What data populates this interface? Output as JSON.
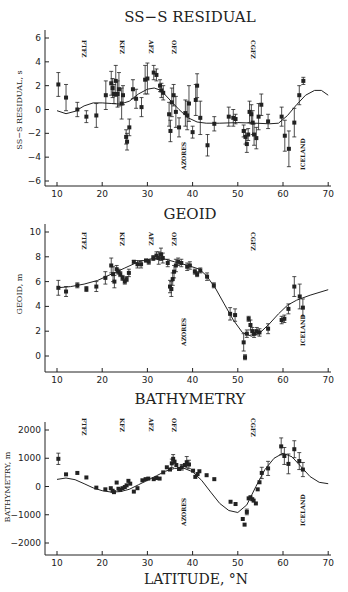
{
  "chart_data": [
    {
      "type": "scatter",
      "title": "SS−S RESIDUAL",
      "xlabel": "",
      "ylabel": "SS−S RESIDUAL, s",
      "xlim": [
        8,
        71
      ],
      "ylim": [
        -6.5,
        6.5
      ],
      "xticks": [
        "10",
        "20",
        "30",
        "40",
        "50",
        "60",
        "70"
      ],
      "yticks": [
        "6",
        "4",
        "2",
        "0",
        "−2",
        "−4",
        "−6"
      ],
      "ytick_values": [
        6,
        4,
        2,
        0,
        -2,
        -4,
        -6
      ],
      "features_top": [
        {
          "label": "FTFZ",
          "lat": 15
        },
        {
          "label": "KFZ",
          "lat": 23.5
        },
        {
          "label": "AFZ",
          "lat": 30
        },
        {
          "label": "OFZ",
          "lat": 35
        },
        {
          "label": "CGFZ",
          "lat": 52.5
        }
      ],
      "features_bottom": [
        {
          "label": "AZORES",
          "lat": 38
        },
        {
          "label": "ICELAND",
          "lat": 64.5
        }
      ],
      "points": [
        [
          10.3,
          2.1,
          1.0
        ],
        [
          12,
          1.0,
          1.1
        ],
        [
          14.5,
          0,
          0.6
        ],
        [
          16.5,
          -0.6,
          0.5
        ],
        [
          18.7,
          -0.5,
          1.0
        ],
        [
          20.8,
          1.2,
          1.2
        ],
        [
          22,
          2.2,
          1.0
        ],
        [
          22.3,
          1.8,
          0.8
        ],
        [
          22.6,
          1.3,
          0.8
        ],
        [
          23,
          2.4,
          1.3
        ],
        [
          23.4,
          1.3,
          1.1
        ],
        [
          23.7,
          1.7,
          1.4
        ],
        [
          24.3,
          0.5,
          1.3
        ],
        [
          24.6,
          1.2,
          0.8
        ],
        [
          25.3,
          -2.3,
          0.6
        ],
        [
          25.5,
          -2.7,
          0.7
        ],
        [
          26,
          -1.5,
          0.7
        ],
        [
          26.8,
          1.7,
          0.8
        ],
        [
          27.5,
          0.9,
          0.8
        ],
        [
          28.7,
          0.2,
          0.8
        ],
        [
          29.5,
          2.5,
          1.2
        ],
        [
          30,
          2.6,
          1.3
        ],
        [
          31.4,
          3.1,
          0.6
        ],
        [
          32,
          2.9,
          0.5
        ],
        [
          32.8,
          2.0,
          0.5
        ],
        [
          33.1,
          1.6,
          0.6
        ],
        [
          33.5,
          1.4,
          0.6
        ],
        [
          34.8,
          -0.4,
          1.0
        ],
        [
          35.1,
          -1.8,
          0.9
        ],
        [
          35.4,
          0.6,
          1.2
        ],
        [
          35.8,
          1.2,
          0.9
        ],
        [
          36.3,
          -0.2,
          1.3
        ],
        [
          37,
          -1.5,
          0.8
        ],
        [
          38.4,
          -0.3,
          1.1
        ],
        [
          38.8,
          -0.5,
          1.2
        ],
        [
          39.2,
          0.5,
          1.5
        ],
        [
          40,
          -1.9,
          0.5
        ],
        [
          40.7,
          0.8,
          1.3
        ],
        [
          41,
          2.0,
          1.0
        ],
        [
          41.7,
          -0.7,
          1.4
        ],
        [
          43.3,
          -3.0,
          0.9
        ],
        [
          44.8,
          -1.2,
          0.6
        ],
        [
          48,
          -0.6,
          0.8
        ],
        [
          49,
          -0.7,
          0.7
        ],
        [
          49.5,
          -0.8,
          0.4
        ],
        [
          51.3,
          -1.8,
          0.5
        ],
        [
          51.7,
          -2.3,
          0.6
        ],
        [
          52,
          -2.9,
          0.7
        ],
        [
          52.3,
          -2.1,
          0.5
        ],
        [
          52.6,
          -0.2,
          0.9
        ],
        [
          53,
          -0.4,
          0.8
        ],
        [
          53.3,
          -1.1,
          1.0
        ],
        [
          53.6,
          -2.1,
          0.9
        ],
        [
          54.1,
          -2.4,
          0.9
        ],
        [
          54.6,
          -0.6,
          1.1
        ],
        [
          55.2,
          0.4,
          0.9
        ],
        [
          56.7,
          -1.0,
          0.6
        ],
        [
          59.7,
          -0.6,
          0.8
        ],
        [
          60.4,
          -2.2,
          1.3
        ],
        [
          61.3,
          -3.3,
          1.5
        ],
        [
          62.5,
          -1.1,
          1.2
        ],
        [
          63.6,
          1.2,
          0.8
        ],
        [
          64.5,
          2.4,
          0.3
        ]
      ],
      "curve": [
        [
          10,
          -0.1
        ],
        [
          12,
          -0.35
        ],
        [
          14,
          -0.15
        ],
        [
          16,
          0.3
        ],
        [
          18,
          0.55
        ],
        [
          20,
          0.55
        ],
        [
          22,
          0.5
        ],
        [
          24,
          0.45
        ],
        [
          26,
          0.7
        ],
        [
          28,
          1.3
        ],
        [
          30,
          1.7
        ],
        [
          31.5,
          1.8
        ],
        [
          33,
          1.6
        ],
        [
          35,
          0.8
        ],
        [
          37,
          0
        ],
        [
          39,
          -0.7
        ],
        [
          41,
          -1.05
        ],
        [
          43,
          -1.15
        ],
        [
          46,
          -1.15
        ],
        [
          50,
          -1.1
        ],
        [
          54,
          -1.15
        ],
        [
          57,
          -1.2
        ],
        [
          59,
          -1.15
        ],
        [
          61,
          -0.5
        ],
        [
          63,
          0.4
        ],
        [
          65,
          1.2
        ],
        [
          67,
          1.6
        ],
        [
          68.5,
          1.6
        ],
        [
          70,
          1.2
        ]
      ]
    },
    {
      "type": "scatter",
      "title": "GEOID",
      "xlabel": "",
      "ylabel": "GEOID, m",
      "xlim": [
        8,
        71
      ],
      "ylim": [
        -1.2,
        10.3
      ],
      "xticks": [
        "10",
        "20",
        "30",
        "40",
        "50",
        "60",
        "70"
      ],
      "yticks": [
        "10",
        "8",
        "6",
        "4",
        "2",
        "0"
      ],
      "ytick_values": [
        10,
        8,
        6,
        4,
        2,
        0
      ],
      "features_top": [
        {
          "label": "FTFZ",
          "lat": 15
        },
        {
          "label": "KFZ",
          "lat": 23.5
        },
        {
          "label": "AFZ",
          "lat": 30
        },
        {
          "label": "OFZ",
          "lat": 35
        },
        {
          "label": "CGFZ",
          "lat": 52.5
        }
      ],
      "features_bottom": [
        {
          "label": "AZORES",
          "lat": 38
        },
        {
          "label": "ICELAND",
          "lat": 64.5
        }
      ],
      "points": [
        [
          10.3,
          5.5,
          0.6
        ],
        [
          12,
          5.2,
          0.4
        ],
        [
          14.5,
          5.7,
          0.2
        ],
        [
          16.5,
          5.4,
          0.2
        ],
        [
          18.7,
          5.6,
          0.4
        ],
        [
          20.7,
          6.3,
          0.5
        ],
        [
          22,
          7.3,
          0.6
        ],
        [
          22.4,
          6.6,
          0.6
        ],
        [
          22.7,
          6.0,
          0.5
        ],
        [
          23.2,
          7.0,
          0.3
        ],
        [
          23.6,
          6.8,
          0.2
        ],
        [
          24,
          6.6,
          0.2
        ],
        [
          24.5,
          6.3,
          0.2
        ],
        [
          25,
          6.0,
          0.2
        ],
        [
          25.4,
          6.2,
          0.2
        ],
        [
          25.9,
          6.7,
          0.3
        ],
        [
          27,
          7.6,
          0.1
        ],
        [
          27.8,
          7.4,
          0.3
        ],
        [
          28.6,
          7.4,
          0.3
        ],
        [
          29.7,
          7.7,
          0.1
        ],
        [
          30.3,
          7.6,
          0.2
        ],
        [
          31.3,
          7.9,
          0.2
        ],
        [
          32,
          8.1,
          0.3
        ],
        [
          32.5,
          7.9,
          0.5
        ],
        [
          33,
          8.2,
          0.5
        ],
        [
          33.4,
          7.9,
          0.4
        ],
        [
          34.5,
          7.5,
          0.3
        ],
        [
          35,
          5.6,
          0.5
        ],
        [
          35.3,
          5.4,
          0.6
        ],
        [
          35.6,
          6.2,
          0.5
        ],
        [
          35.9,
          6.8,
          0.5
        ],
        [
          36.3,
          7.3,
          0.5
        ],
        [
          36.8,
          7.6,
          0.3
        ],
        [
          37.5,
          7.5,
          0.3
        ],
        [
          38.8,
          7.2,
          0.3
        ],
        [
          39.4,
          7.3,
          0.3
        ],
        [
          40.5,
          6.8,
          0.2
        ],
        [
          41,
          6.6,
          0.2
        ],
        [
          41.7,
          6.9,
          0.2
        ],
        [
          43.2,
          6.4,
          0.3
        ],
        [
          44.7,
          5.7,
          0.2
        ],
        [
          48.3,
          3.4,
          0.5
        ],
        [
          49.4,
          3.3,
          0.5
        ],
        [
          51.3,
          1.1,
          0.7
        ],
        [
          51.6,
          -0.1,
          0.2
        ],
        [
          52,
          1.8,
          0.3
        ],
        [
          52.4,
          3.0,
          0.2
        ],
        [
          52.8,
          2.5,
          0.4
        ],
        [
          53.2,
          2.0,
          0.3
        ],
        [
          53.6,
          1.8,
          0.3
        ],
        [
          54.2,
          2.0,
          0.3
        ],
        [
          54.8,
          1.9,
          0.3
        ],
        [
          56.7,
          2.2,
          0.4
        ],
        [
          59.7,
          2.9,
          0.3
        ],
        [
          60.3,
          3.0,
          0.3
        ],
        [
          61.2,
          3.8,
          0.4
        ],
        [
          62.5,
          5.6,
          0.8
        ],
        [
          63.7,
          4.8,
          1.0
        ],
        [
          64.4,
          3.9,
          0.7
        ]
      ],
      "curve": [
        [
          10,
          5.5
        ],
        [
          13,
          5.6
        ],
        [
          16,
          5.8
        ],
        [
          19,
          6.1
        ],
        [
          22,
          6.6
        ],
        [
          25,
          7.1
        ],
        [
          28,
          7.6
        ],
        [
          31,
          7.85
        ],
        [
          33,
          7.9
        ],
        [
          36,
          7.6
        ],
        [
          39,
          7.3
        ],
        [
          41.5,
          7.0
        ],
        [
          43,
          6.5
        ],
        [
          45,
          5.5
        ],
        [
          47,
          4.2
        ],
        [
          49,
          2.9
        ],
        [
          51,
          1.9
        ],
        [
          53,
          1.6
        ],
        [
          55,
          1.9
        ],
        [
          57,
          2.6
        ],
        [
          59,
          3.4
        ],
        [
          61,
          4.1
        ],
        [
          63,
          4.5
        ],
        [
          66,
          4.9
        ],
        [
          70,
          5.35
        ]
      ]
    },
    {
      "type": "scatter",
      "title": "BATHYMETRY",
      "xlabel": "LATITUDE, °N",
      "ylabel": "BATHYMETRY, m",
      "xlim": [
        8,
        71
      ],
      "ylim": [
        -2400,
        2700
      ],
      "xticks": [
        "10",
        "20",
        "30",
        "40",
        "50",
        "60",
        "70"
      ],
      "yticks": [
        "2000",
        "1000",
        "0",
        "−1000",
        "−2000"
      ],
      "ytick_values": [
        2000,
        1000,
        0,
        -1000,
        -2000
      ],
      "features_top": [
        {
          "label": "FTFZ",
          "lat": 15
        },
        {
          "label": "KFZ",
          "lat": 23.5
        },
        {
          "label": "AFZ",
          "lat": 30
        },
        {
          "label": "OFZ",
          "lat": 35
        },
        {
          "label": "CGFZ",
          "lat": 52.5
        }
      ],
      "features_bottom": [
        {
          "label": "AZORES",
          "lat": 38
        },
        {
          "label": "ICELAND",
          "lat": 64.5
        }
      ],
      "points": [
        [
          10.3,
          980,
          200
        ],
        [
          12,
          430,
          0
        ],
        [
          14.5,
          480,
          0
        ],
        [
          16.5,
          320,
          0
        ],
        [
          18.7,
          -40,
          0
        ],
        [
          20.7,
          -100,
          0
        ],
        [
          21.9,
          -60,
          0
        ],
        [
          22.3,
          -150,
          0
        ],
        [
          22.6,
          -200,
          0
        ],
        [
          23.2,
          140,
          0
        ],
        [
          23.6,
          -80,
          0
        ],
        [
          24,
          -120,
          0
        ],
        [
          24.5,
          -60,
          0
        ],
        [
          25,
          -20,
          0
        ],
        [
          25.4,
          40,
          0
        ],
        [
          25.8,
          200,
          0
        ],
        [
          26.2,
          100,
          0
        ],
        [
          27,
          -180,
          0
        ],
        [
          27.8,
          -60,
          0
        ],
        [
          28.9,
          220,
          0
        ],
        [
          29.6,
          260,
          0
        ],
        [
          30.2,
          280,
          0
        ],
        [
          31.4,
          260,
          0
        ],
        [
          32,
          300,
          0
        ],
        [
          32.7,
          280,
          0
        ],
        [
          33.5,
          500,
          0
        ],
        [
          34.3,
          680,
          0
        ],
        [
          35,
          600,
          0
        ],
        [
          35.4,
          820,
          150
        ],
        [
          35.7,
          980,
          150
        ],
        [
          36,
          880,
          0
        ],
        [
          36.4,
          760,
          0
        ],
        [
          37,
          620,
          0
        ],
        [
          37.6,
          680,
          100
        ],
        [
          38.3,
          760,
          0
        ],
        [
          38.7,
          860,
          200
        ],
        [
          39.2,
          780,
          150
        ],
        [
          40.1,
          560,
          0
        ],
        [
          40.6,
          340,
          0
        ],
        [
          41.1,
          440,
          0
        ],
        [
          41.5,
          540,
          0
        ],
        [
          43.1,
          400,
          0
        ],
        [
          44.8,
          260,
          0
        ],
        [
          48.4,
          -540,
          0
        ],
        [
          49.5,
          -620,
          0
        ],
        [
          51.1,
          -1150,
          0
        ],
        [
          51.5,
          -1350,
          0
        ],
        [
          52,
          -900,
          100
        ],
        [
          52.4,
          -420,
          0
        ],
        [
          52.8,
          -380,
          0
        ],
        [
          53.2,
          -450,
          0
        ],
        [
          53.5,
          -500,
          0
        ],
        [
          54,
          -600,
          0
        ],
        [
          54.4,
          -100,
          0
        ],
        [
          54.8,
          150,
          0
        ],
        [
          55.3,
          480,
          200
        ],
        [
          56.7,
          640,
          250
        ],
        [
          59.6,
          1420,
          300
        ],
        [
          60.3,
          1080,
          300
        ],
        [
          61.2,
          800,
          350
        ],
        [
          62.5,
          1320,
          300
        ],
        [
          63.6,
          900,
          300
        ],
        [
          64.4,
          600,
          250
        ]
      ],
      "curve": [
        [
          10,
          250
        ],
        [
          12,
          300
        ],
        [
          14,
          240
        ],
        [
          16,
          100
        ],
        [
          18,
          -50
        ],
        [
          20,
          -150
        ],
        [
          22,
          -200
        ],
        [
          24,
          -180
        ],
        [
          26,
          -100
        ],
        [
          28,
          60
        ],
        [
          30,
          220
        ],
        [
          32,
          380
        ],
        [
          34,
          540
        ],
        [
          36,
          640
        ],
        [
          38,
          650
        ],
        [
          40,
          520
        ],
        [
          42,
          220
        ],
        [
          44,
          -200
        ],
        [
          46,
          -600
        ],
        [
          48,
          -850
        ],
        [
          50,
          -920
        ],
        [
          52,
          -650
        ],
        [
          54,
          0
        ],
        [
          56,
          600
        ],
        [
          58,
          1000
        ],
        [
          60,
          1180
        ],
        [
          62,
          1050
        ],
        [
          64,
          700
        ],
        [
          66,
          350
        ],
        [
          68,
          150
        ],
        [
          70,
          100
        ]
      ]
    }
  ]
}
